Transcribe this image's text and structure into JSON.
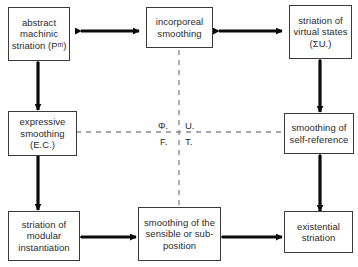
{
  "diagram": {
    "nodes": [
      {
        "id": "abstract-machinic-striation",
        "label": "abstract machinic striation (Pᵐ)"
      },
      {
        "id": "incorporeal-smoothing",
        "label": "incorporeal smoothing"
      },
      {
        "id": "striation-of-virtual-states",
        "label": "striation of virtual states (ΣU.)"
      },
      {
        "id": "expressive-smoothing",
        "label": "expressive smoothing (E.C.)"
      },
      {
        "id": "smoothing-of-self-reference",
        "label": "smoothing of self-reference"
      },
      {
        "id": "striation-of-modular-instantiation",
        "label": "striation of modular instantiation"
      },
      {
        "id": "smoothing-of-the-sensible",
        "label": "smoothing of the sensible or sub-position"
      },
      {
        "id": "existential-striation",
        "label": "existential striation"
      }
    ],
    "axis_labels": {
      "top_left": "Φ.",
      "top_right": "U.",
      "bottom_left": "F.",
      "bottom_right": "T."
    },
    "colors": {
      "box_border": "#3a3a3a",
      "arrow": "#0a0a0a",
      "dashed_axis": "#8c8c8c",
      "text": "#2b2b2b",
      "background": "#ffffff"
    }
  }
}
